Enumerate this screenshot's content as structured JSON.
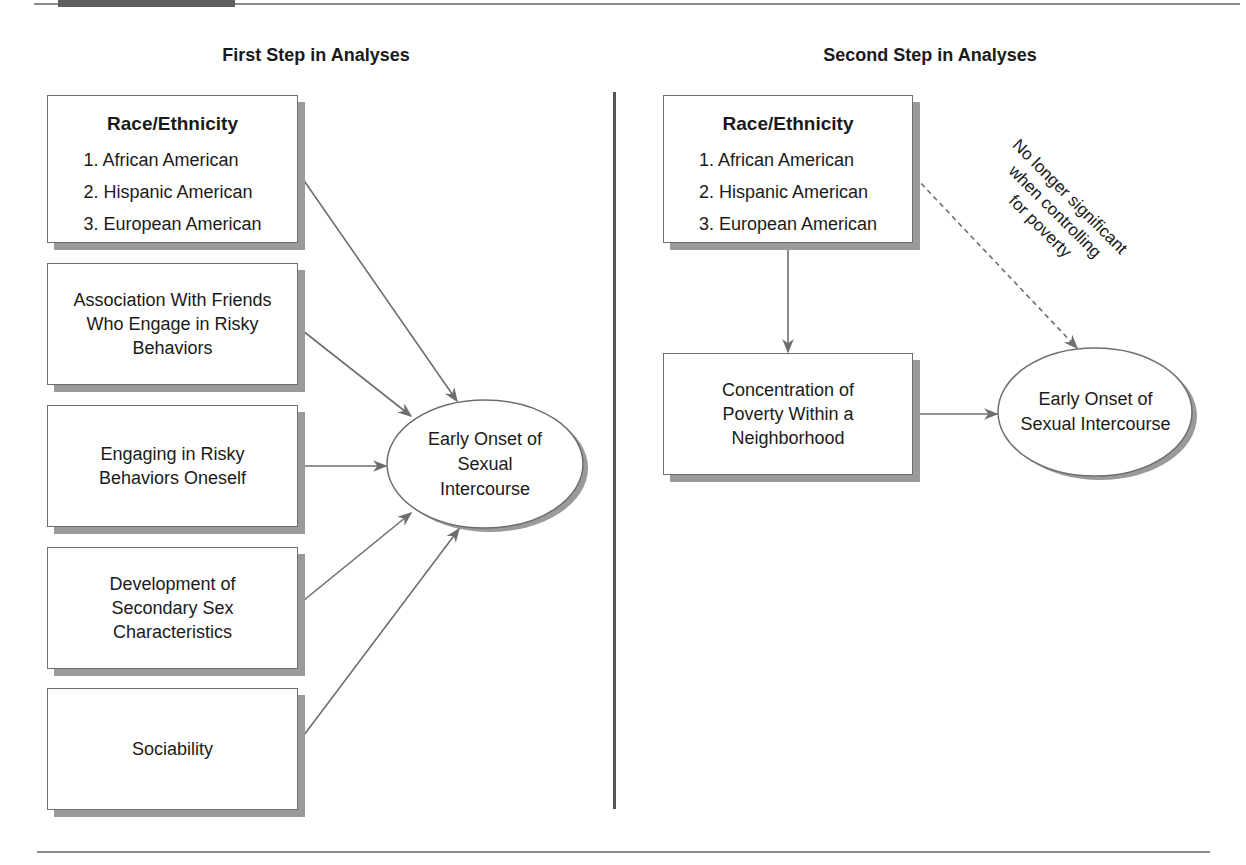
{
  "panels": {
    "first": {
      "title": "First Step in Analyses",
      "race_box": {
        "heading": "Race/Ethnicity",
        "items": [
          "1. African American",
          "2. Hispanic American",
          "3. European American"
        ]
      },
      "predictors": [
        "Association With Friends Who Engage in Risky Behaviors",
        "Engaging in Risky Behaviors Oneself",
        "Development of Secondary Sex Characteristics",
        "Sociability"
      ],
      "predictor_lines": [
        [
          "Association With Friends",
          "Who Engage in Risky",
          "Behaviors"
        ],
        [
          "Engaging in Risky",
          "Behaviors Oneself"
        ],
        [
          "Development of",
          "Secondary Sex",
          "Characteristics"
        ],
        [
          "Sociability"
        ]
      ],
      "outcome_lines": [
        "Early Onset of",
        "Sexual",
        "Intercourse"
      ]
    },
    "second": {
      "title": "Second Step in Analyses",
      "race_box": {
        "heading": "Race/Ethnicity",
        "items": [
          "1. African American",
          "2. Hispanic American",
          "3. European American"
        ]
      },
      "mediator_lines": [
        "Concentration of",
        "Poverty Within a",
        "Neighborhood"
      ],
      "outcome_lines": [
        "Early Onset of",
        "Sexual Intercourse"
      ],
      "note_lines": [
        "No longer significant",
        "when controlling",
        "for poverty"
      ]
    }
  },
  "colors": {
    "line": "#6e6e6e",
    "shadow": "#9a9a9a",
    "rule": "#8a8a8a",
    "divider": "#555555"
  }
}
